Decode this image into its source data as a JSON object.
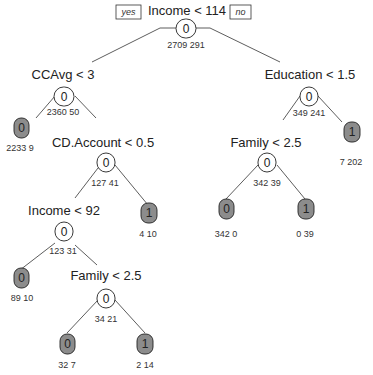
{
  "tree": {
    "branch_labels": {
      "yes": "yes",
      "no": "no"
    },
    "nodes": {
      "root": {
        "split": "Income < 114",
        "class": "0",
        "counts": "2709  291"
      },
      "ccavg": {
        "split": "CCAvg < 3",
        "class": "0",
        "counts": "2360  50"
      },
      "leaf_a": {
        "class": "0",
        "counts": "2233  9"
      },
      "cdaccount": {
        "split": "CD.Account < 0.5",
        "class": "0",
        "counts": "127  41"
      },
      "income92": {
        "split": "Income < 92",
        "class": "0",
        "counts": "123  31"
      },
      "leaf_b": {
        "class": "0",
        "counts": "89  10"
      },
      "family_l": {
        "split": "Family < 2.5",
        "class": "0",
        "counts": "34  21"
      },
      "leaf_c": {
        "class": "0",
        "counts": "32  7"
      },
      "leaf_d": {
        "class": "1",
        "counts": "2  14"
      },
      "leaf_e": {
        "class": "1",
        "counts": "4  10"
      },
      "education": {
        "split": "Education < 1.5",
        "class": "0",
        "counts": "349  241"
      },
      "family_r": {
        "split": "Family < 2.5",
        "class": "0",
        "counts": "342  39"
      },
      "leaf_f": {
        "class": "0",
        "counts": "342  0"
      },
      "leaf_g": {
        "class": "1",
        "counts": "0  39"
      },
      "leaf_h": {
        "class": "1",
        "counts": "7  202"
      }
    }
  }
}
